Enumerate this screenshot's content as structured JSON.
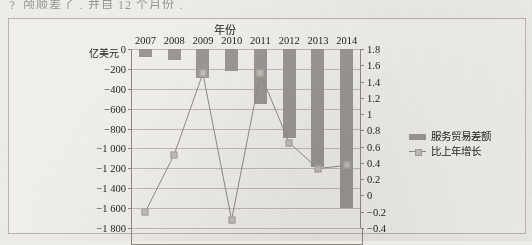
{
  "page": {
    "top_cut_text": "﹖ 颅顺差了﹐并自 12 个月份﹒"
  },
  "legend": {
    "position": "right",
    "items": [
      {
        "label": "服务贸易差额",
        "marker": "bar-swatch",
        "color": "#9b9893"
      },
      {
        "label": "比上年增长",
        "marker": "line-swatch",
        "color": "#8f8c86"
      }
    ]
  },
  "chart_data": {
    "type": "bar",
    "title": "",
    "xlabel": "年份",
    "ylabel": "亿美元",
    "categories": [
      "2007",
      "2008",
      "2009",
      "2010",
      "2011",
      "2012",
      "2013",
      "2014"
    ],
    "grid": true,
    "series": [
      {
        "name": "服务贸易差额",
        "type": "bar",
        "axis": "left",
        "unit": "亿美元",
        "color": "#9b9893",
        "values": [
          -80,
          -110,
          -294,
          -218,
          -552,
          -897,
          -1185,
          -1598
        ]
      },
      {
        "name": "比上年增长",
        "type": "line",
        "axis": "right",
        "color": "#8f8c86",
        "values": [
          -0.2,
          0.5,
          1.5,
          -0.3,
          1.5,
          0.65,
          0.33,
          0.37
        ]
      }
    ],
    "left_axis": {
      "label": "亿美元",
      "lim": [
        -1800,
        0
      ],
      "ticks": [
        0,
        -200,
        -400,
        -600,
        -800,
        -1000,
        -1200,
        -1400,
        -1600,
        -1800
      ],
      "tick_labels": [
        "0",
        "−200",
        "−400",
        "−600",
        "−800",
        "−1 000",
        "−1 200",
        "−1 400",
        "−1 600",
        "−1 800"
      ]
    },
    "right_axis": {
      "lim": [
        -0.4,
        1.8
      ],
      "ticks": [
        1.8,
        1.6,
        1.4,
        1.2,
        1.0,
        0.8,
        0.6,
        0.4,
        0.2,
        0.0,
        -0.2,
        -0.4
      ],
      "tick_labels": [
        "1.8",
        "1.6",
        "1.4",
        "1.2",
        "1",
        "0.8",
        "0.6",
        "0.4",
        "0.2",
        "0",
        "−0.2",
        "−0.4"
      ]
    }
  }
}
